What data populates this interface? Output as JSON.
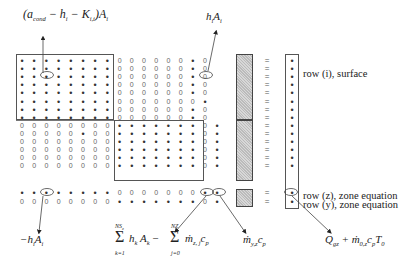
{
  "annotations": {
    "top_left": {
      "text": "(a_cond − h_i − K_i,i) A_i",
      "parts": [
        "(",
        "a",
        "cond",
        " − h",
        "i",
        " − K",
        "i,i",
        ")A",
        "i"
      ]
    },
    "top_right": {
      "text": "h_i A_i",
      "parts": [
        "h",
        "i",
        "A",
        "i"
      ]
    },
    "bottom_left": {
      "text": "−h_i A_i",
      "parts": [
        "−h",
        "i",
        "A",
        "i"
      ]
    },
    "bottom_sum": {
      "text": "Σ_{k=1}^{NS_z} h_k A_k − Σ_{j=0}^{NZ} ṁ_{z,j} c_p",
      "sum1_top": "NS",
      "sum1_top_sub": "z",
      "sum1_bottom": "k=1",
      "term1": "h",
      "term1_sub": "k",
      "term1b": "A",
      "term1b_sub": "k",
      "minus": "−",
      "sum2_top": "NZ",
      "sum2_bottom": "j=0",
      "term2": "ṁ",
      "term2_sub": "z, j",
      "term2b": "c",
      "term2b_sub": "p"
    },
    "bottom_mid": {
      "text": "ṁ_y,z c_p",
      "term": "ṁ",
      "sub": "y,z",
      "term2": "c",
      "sub2": "p"
    },
    "bottom_right": {
      "text": "Q_gz + ṁ_0,z c_p T_0",
      "q": "Q",
      "q_sub": "gz",
      "plus": "+ ṁ",
      "m_sub": "0,z",
      "c": "c",
      "c_sub": "p",
      "t": "T",
      "t_sub": "0"
    }
  },
  "row_labels": {
    "surface": "row (i), surface",
    "zone_z": "row (z), zone equation",
    "zone_y": "row (y), zone equation"
  },
  "matrix": {
    "dot": "•",
    "zero": "0",
    "equals": "=",
    "rows": [
      "********000000*0",
      "********000000*0",
      "********000000*0",
      "********000000*0",
      "********000000*0",
      "********0000000*",
      "********000000*0",
      "********000000*0",
      "00000000*******0*",
      "00000*00*******0*",
      "00000000*******0*",
      "00000000*******0*",
      "00000000*******0*",
      "00000000*******0*",
      "********0000000**",
      "00000000*******0*"
    ]
  }
}
